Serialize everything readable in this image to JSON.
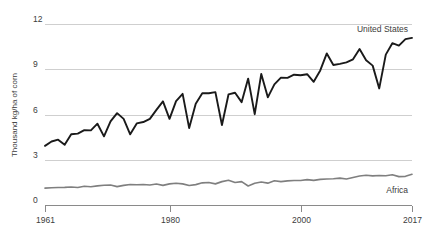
{
  "chart_data": {
    "type": "line",
    "title": "",
    "xlabel": "",
    "ylabel": "Thousand kg/ha of corn",
    "xlim": [
      1961,
      2017
    ],
    "ylim": [
      0,
      12
    ],
    "grid": true,
    "legend_position": "inline-right",
    "ytick_labels": [
      "12",
      "9",
      "6",
      "3",
      "0"
    ],
    "yticks": [
      12,
      9,
      6,
      3,
      0
    ],
    "xtick_labels": [
      "1961",
      "1980",
      "2000",
      "2017"
    ],
    "xticks": [
      1961,
      1980,
      2000,
      2017
    ],
    "x": [
      1961,
      1962,
      1963,
      1964,
      1965,
      1966,
      1967,
      1968,
      1969,
      1970,
      1971,
      1972,
      1973,
      1974,
      1975,
      1976,
      1977,
      1978,
      1979,
      1980,
      1981,
      1982,
      1983,
      1984,
      1985,
      1986,
      1987,
      1988,
      1989,
      1990,
      1991,
      1992,
      1993,
      1994,
      1995,
      1996,
      1997,
      1998,
      1999,
      2000,
      2001,
      2002,
      2003,
      2004,
      2005,
      2006,
      2007,
      2008,
      2009,
      2010,
      2011,
      2012,
      2013,
      2014,
      2015,
      2016,
      2017
    ],
    "series": [
      {
        "name": "United States",
        "color": "#1a1a1a",
        "values": [
          3.92,
          4.21,
          4.33,
          3.99,
          4.69,
          4.73,
          4.96,
          4.95,
          5.39,
          4.55,
          5.54,
          6.09,
          5.71,
          4.69,
          5.41,
          5.5,
          5.71,
          6.31,
          6.87,
          5.71,
          6.89,
          7.37,
          5.1,
          6.72,
          7.41,
          7.41,
          7.48,
          5.3,
          7.33,
          7.44,
          6.82,
          8.38,
          6.02,
          8.69,
          7.14,
          8.0,
          8.44,
          8.43,
          8.64,
          8.6,
          8.67,
          8.17,
          8.92,
          10.05,
          9.28,
          9.36,
          9.46,
          9.66,
          10.34,
          9.59,
          9.24,
          7.73,
          9.97,
          10.73,
          10.57,
          11.0,
          11.08
        ]
      },
      {
        "name": "Africa",
        "color": "#7f7f7f",
        "values": [
          1.12,
          1.14,
          1.16,
          1.17,
          1.19,
          1.16,
          1.24,
          1.21,
          1.27,
          1.31,
          1.32,
          1.22,
          1.3,
          1.36,
          1.34,
          1.36,
          1.33,
          1.39,
          1.3,
          1.4,
          1.44,
          1.4,
          1.29,
          1.35,
          1.47,
          1.49,
          1.4,
          1.55,
          1.64,
          1.49,
          1.55,
          1.26,
          1.44,
          1.52,
          1.45,
          1.61,
          1.55,
          1.6,
          1.62,
          1.62,
          1.68,
          1.63,
          1.7,
          1.72,
          1.74,
          1.78,
          1.72,
          1.82,
          1.92,
          1.97,
          1.93,
          1.96,
          1.94,
          2.0,
          1.88,
          1.9,
          2.04
        ]
      }
    ],
    "annotations": [
      {
        "name": "United States",
        "x": 2017,
        "y": 11.55
      },
      {
        "name": "Africa",
        "x": 2016,
        "y": 1.1
      }
    ]
  }
}
